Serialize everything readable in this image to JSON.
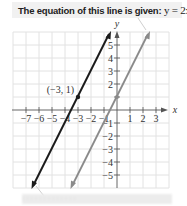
{
  "title": {
    "prefix": "The equation of this line is given: ",
    "equation": "y = 2x + 1."
  },
  "graph": {
    "x_axis_label": "x",
    "y_axis_label": "y",
    "x_ticks": [
      "−7",
      "−6",
      "−5",
      "−4",
      "−3",
      "−2",
      "−1",
      "1",
      "2",
      "3"
    ],
    "y_ticks": [
      "5",
      "4",
      "3",
      "2",
      "1",
      "−1",
      "−2",
      "−3",
      "−4",
      "−5"
    ],
    "point_label": "(−3, 1)",
    "colors": {
      "dark_line": "#1a1a1a",
      "gray_line": "#8a8a8a",
      "grid": "#e2e2e2",
      "axis": "#555555"
    }
  },
  "footer": {
    "text": "· · · · · · · · · · · · ·"
  }
}
